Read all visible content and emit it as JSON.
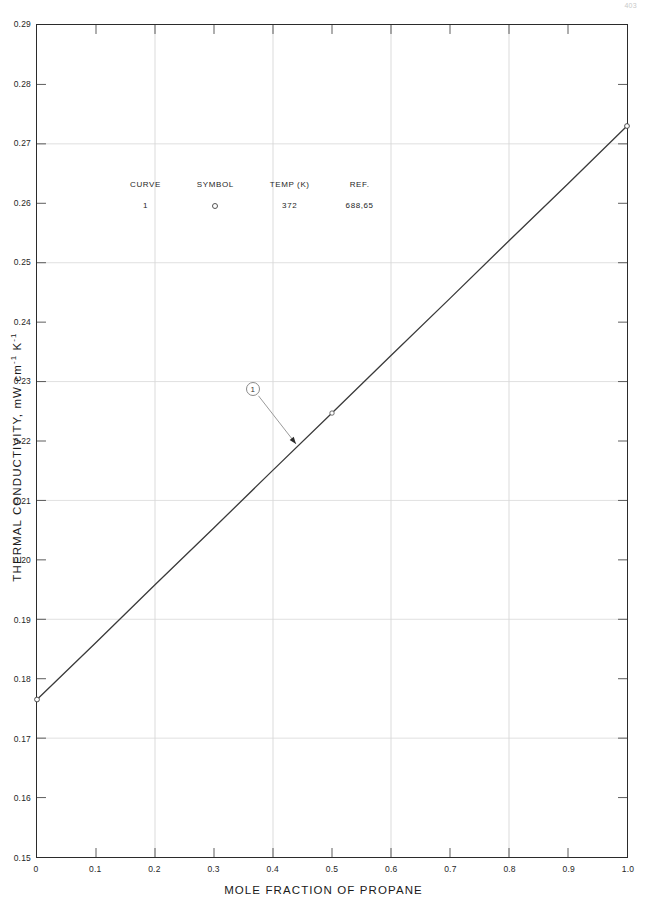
{
  "page": {
    "number": "403"
  },
  "chart_data": {
    "type": "line",
    "title": "",
    "xlabel": "MOLE FRACTION OF PROPANE",
    "ylabel": "THERMAL CONDUCTIVITY, mW cm",
    "ylabel_sup1": "-1",
    "ylabel_mid": " K",
    "ylabel_sup2": "-1",
    "xlim": [
      0,
      1.0
    ],
    "ylim": [
      0.15,
      0.29
    ],
    "grid": true,
    "grid_x_step": 0.2,
    "grid_y_step": 0.02,
    "xticks": [
      "0",
      "0.1",
      "0.2",
      "0.3",
      "0.4",
      "0.5",
      "0.6",
      "0.7",
      "0.8",
      "0.9",
      "1.0"
    ],
    "xtick_values": [
      0,
      0.1,
      0.2,
      0.3,
      0.4,
      0.5,
      0.6,
      0.7,
      0.8,
      0.9,
      1.0
    ],
    "yticks": [
      "0.15",
      "0.16",
      "0.17",
      "0.18",
      "0.19",
      "0.20",
      "0.21",
      "0.22",
      "0.23",
      "0.24",
      "0.25",
      "0.26",
      "0.27",
      "0.28",
      "0.29"
    ],
    "ytick_values": [
      0.15,
      0.16,
      0.17,
      0.18,
      0.19,
      0.2,
      0.21,
      0.22,
      0.23,
      0.24,
      0.25,
      0.26,
      0.27,
      0.28,
      0.29
    ],
    "series": [
      {
        "name": "1",
        "temp_k": "372",
        "ref": "688,65",
        "symbol": "open-circle",
        "x": [
          0.0,
          0.1,
          0.2,
          0.3,
          0.4,
          0.5,
          0.6,
          0.7,
          0.8,
          0.9,
          1.0
        ],
        "values": [
          0.1765,
          0.1861,
          0.1958,
          0.2054,
          0.2151,
          0.2247,
          0.2344,
          0.244,
          0.2537,
          0.2633,
          0.273
        ]
      }
    ],
    "annotations": [
      {
        "label": "1",
        "x": 0.366,
        "y": 0.2288,
        "points_to_x": 0.439,
        "points_to_y": 0.2195
      }
    ]
  },
  "legend": {
    "headers": [
      "CURVE",
      "SYMBOL",
      "TEMP (K)",
      "REF."
    ],
    "rows": [
      {
        "curve": "1",
        "symbol": "",
        "temp": "372",
        "ref": "688,65"
      }
    ]
  }
}
